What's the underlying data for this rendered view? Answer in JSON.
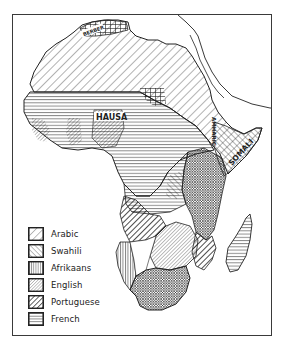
{
  "map": {
    "title": "Languages of Africa",
    "region_labels": [
      {
        "id": "berber",
        "text": "BERBER"
      },
      {
        "id": "hausa",
        "text": "HAUSA"
      },
      {
        "id": "amharic",
        "text": "AMHARIC"
      },
      {
        "id": "somali",
        "text": "SOMALI"
      }
    ]
  },
  "legend": {
    "items": [
      {
        "label": "Arabic",
        "pattern": "diagonal-wide-forward"
      },
      {
        "label": "Swahili",
        "pattern": "diagonal-backward"
      },
      {
        "label": "Afrikaans",
        "pattern": "vertical-lines"
      },
      {
        "label": "English",
        "pattern": "diagonal-fine-forward"
      },
      {
        "label": "Portuguese",
        "pattern": "diagonal-bold-forward"
      },
      {
        "label": "French",
        "pattern": "horizontal-lines"
      }
    ]
  },
  "colors": {
    "ink": "#222222",
    "paper": "#ffffff"
  }
}
